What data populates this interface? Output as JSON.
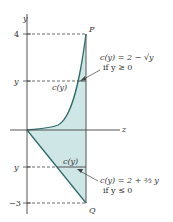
{
  "diagram": {
    "axes": {
      "y_label": "y",
      "x_label": "z"
    },
    "ticks": {
      "top": "4",
      "upper_y": "y",
      "lower_y": "y",
      "bottom": "−3"
    },
    "points": {
      "top": "P",
      "bottom": "Q"
    },
    "strip_labels": {
      "upper": "c(y)",
      "lower": "c(y)"
    },
    "annotations": {
      "upper_eq": "c(y) = 2 − √y",
      "upper_cond": "if y ≥ 0",
      "lower_eq": "c(y) = 2 + ⅔ y",
      "lower_cond": "if y ≤ 0"
    },
    "colors": {
      "fill": "#cfe6e6",
      "curve": "#2f6b6b",
      "axis": "#444444"
    }
  }
}
